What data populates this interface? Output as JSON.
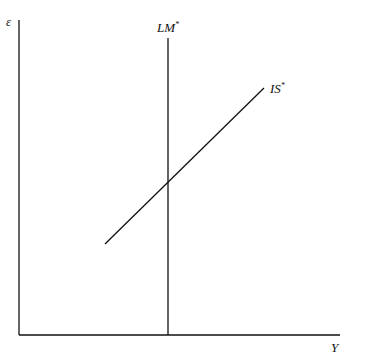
{
  "diagram": {
    "axes": {
      "y_label": "ε",
      "x_label": "Y"
    },
    "curves": [
      {
        "name": "LM",
        "superscript": "*",
        "type": "vertical"
      },
      {
        "name": "IS",
        "superscript": "*",
        "type": "upward-sloping"
      }
    ]
  }
}
